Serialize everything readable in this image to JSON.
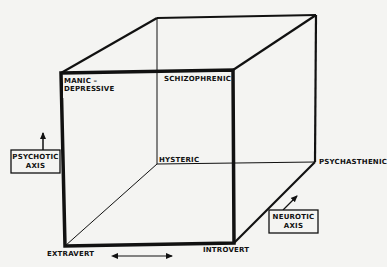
{
  "diagram": {
    "type": "cube-personality-model",
    "colors": {
      "background": "#f4f4f2",
      "ink": "#111111"
    },
    "vertices": {
      "manic_depressive": "MANIC –",
      "manic_depressive_line2": "DEPRESSIVE",
      "schizophrenic": "SCHIZOPHRENIC",
      "hysteric": "HYSTERIC",
      "psychasthenic": "PSYCHASTHENIC",
      "extravert": "EXTRAVERT",
      "introvert": "INTROVERT"
    },
    "axes": {
      "psychotic": {
        "line1": "PSYCHOTIC",
        "line2": "AXIS",
        "arrow": "up"
      },
      "neurotic": {
        "line1": "NEUROTIC",
        "line2": "AXIS",
        "arrow": "diagonal-up-right"
      },
      "extraversion": {
        "arrow": "left-right"
      }
    }
  }
}
